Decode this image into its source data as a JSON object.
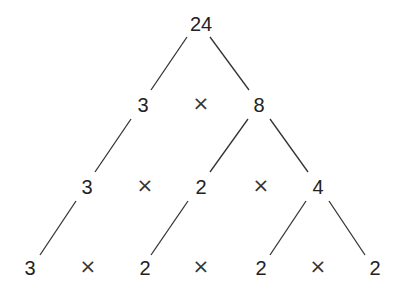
{
  "nodes": {
    "root": "24",
    "l2a": "3",
    "l2b": "8",
    "l3a": "3",
    "l3b": "2",
    "l3c": "4",
    "l4a": "3",
    "l4b": "2",
    "l4c": "2",
    "l4d": "2"
  },
  "times": "×"
}
